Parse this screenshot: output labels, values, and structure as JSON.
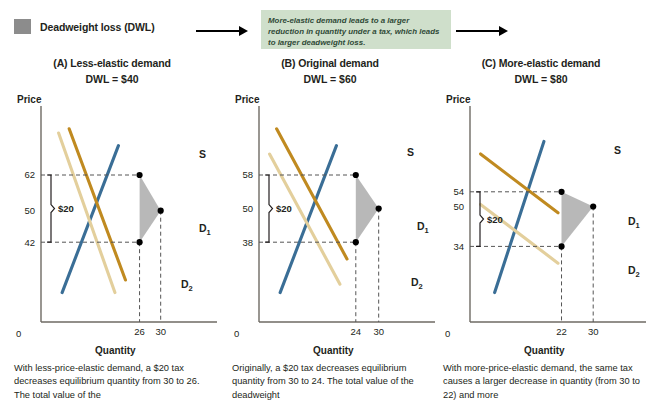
{
  "legend": {
    "label": "Deadweight loss (DWL)",
    "swatch_color": "#8c8c8c"
  },
  "callout": {
    "text": "More-elastic demand leads to a larger reduction in quantity under a tax, which leads to larger deadweight loss.",
    "background": "#cfdfcb"
  },
  "colors": {
    "supply": "#3a6e96",
    "demand_1": "#c08a20",
    "demand_2": "#e3cf9c",
    "dwl_fill": "#8c8c8c",
    "axis": "#6e6a63",
    "dashed": "#555555"
  },
  "axis_titles": {
    "price": "Price",
    "quantity": "Quantity",
    "origin": "0"
  },
  "panels": [
    {
      "id": "A",
      "title": "(A) Less-elastic demand",
      "dwl_label": "DWL = $40",
      "caption": "With less-price-elastic demand, a $20 tax decreases equilibrium quantity from 30 to 26. The total value of the",
      "tax_bracket_label": "$20",
      "curve_labels": {
        "supply": "S",
        "demand_1": "D",
        "demand_1_sub": "1",
        "demand_2": "D",
        "demand_2_sub": "2"
      },
      "chart_data": {
        "type": "line",
        "title": "(A) Less-elastic demand",
        "xlabel": "Quantity",
        "ylabel": "Price",
        "price_ticks": [
          62,
          50,
          42
        ],
        "quantity_ticks": [
          26,
          30
        ],
        "tax": 20,
        "dwl": 40,
        "equilibrium": {
          "price": 50,
          "quantity": 30
        },
        "with_tax": {
          "price_buyers": 62,
          "price_sellers": 42,
          "quantity": 26
        },
        "series": [
          {
            "name": "S",
            "points": [
              [
                12,
                14
              ],
              [
                44,
                84
              ]
            ]
          },
          {
            "name": "D1",
            "points": [
              [
                16,
                92
              ],
              [
                48,
                20
              ]
            ]
          },
          {
            "name": "D2",
            "points": [
              [
                10,
                90
              ],
              [
                42,
                14
              ]
            ]
          }
        ]
      }
    },
    {
      "id": "B",
      "title": "(B) Original demand",
      "dwl_label": "DWL = $60",
      "caption": "Originally, a $20 tax decreases equilibrium quantity from 30 to 24. The total value of the deadweight",
      "tax_bracket_label": "$20",
      "curve_labels": {
        "supply": "S",
        "demand_1": "D",
        "demand_1_sub": "1",
        "demand_2": "D",
        "demand_2_sub": "2"
      },
      "chart_data": {
        "type": "line",
        "title": "(B) Original demand",
        "xlabel": "Quantity",
        "ylabel": "Price",
        "price_ticks": [
          58,
          50,
          38
        ],
        "quantity_ticks": [
          24,
          30
        ],
        "tax": 20,
        "dwl": 60,
        "equilibrium": {
          "price": 50,
          "quantity": 30
        },
        "with_tax": {
          "price_buyers": 58,
          "price_sellers": 38,
          "quantity": 24
        },
        "series": [
          {
            "name": "S",
            "points": [
              [
                12,
                14
              ],
              [
                44,
                84
              ]
            ]
          },
          {
            "name": "D1",
            "points": [
              [
                10,
                92
              ],
              [
                50,
                30
              ]
            ]
          },
          {
            "name": "D2",
            "points": [
              [
                6,
                80
              ],
              [
                46,
                18
              ]
            ]
          }
        ]
      }
    },
    {
      "id": "C",
      "title": "(C) More-elastic demand",
      "dwl_label": "DWL = $80",
      "caption": "With more-price-elastic demand, the same tax causes a larger decrease in quantity (from 30 to 22) and more",
      "tax_bracket_label": "$20",
      "curve_labels": {
        "supply": "S",
        "demand_1": "D",
        "demand_1_sub": "1",
        "demand_2": "D",
        "demand_2_sub": "2"
      },
      "chart_data": {
        "type": "line",
        "title": "(C) More-elastic demand",
        "xlabel": "Quantity",
        "ylabel": "Price",
        "price_ticks": [
          54,
          50,
          34
        ],
        "quantity_ticks": [
          22,
          30
        ],
        "tax": 20,
        "dwl": 80,
        "equilibrium": {
          "price": 50,
          "quantity": 30
        },
        "with_tax": {
          "price_buyers": 54,
          "price_sellers": 34,
          "quantity": 22
        },
        "series": [
          {
            "name": "S",
            "points": [
              [
                14,
                14
              ],
              [
                42,
                86
              ]
            ]
          },
          {
            "name": "D1",
            "points": [
              [
                6,
                80
              ],
              [
                50,
                52
              ]
            ]
          },
          {
            "name": "D2",
            "points": [
              [
                6,
                56
              ],
              [
                50,
                28
              ]
            ]
          }
        ]
      }
    }
  ]
}
